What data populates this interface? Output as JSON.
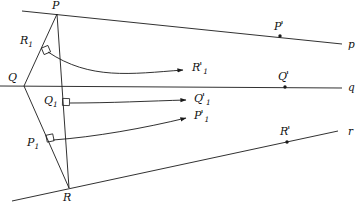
{
  "figure": {
    "kind": "geometry-diagram",
    "background_color": "#ffffff",
    "stroke_color": "#1a1a1a"
  },
  "vertices": [
    {
      "id": "P",
      "label": "P",
      "x": 57,
      "y": 14,
      "label_x": 52,
      "label_y": 0
    },
    {
      "id": "Q",
      "label": "Q",
      "x": 24,
      "y": 86,
      "label_x": 8,
      "label_y": 72
    },
    {
      "id": "R",
      "label": "R",
      "x": 69,
      "y": 188,
      "label_x": 63,
      "label_y": 192
    }
  ],
  "feet": [
    {
      "id": "R1",
      "letter": "R",
      "sub": "1",
      "x": 44,
      "y": 48,
      "label_x": 20,
      "label_y": 35
    },
    {
      "id": "Q1",
      "letter": "Q",
      "sub": "1",
      "x": 64,
      "y": 101,
      "label_x": 44,
      "label_y": 95
    },
    {
      "id": "P1",
      "letter": "P",
      "sub": "1",
      "x": 48,
      "y": 137,
      "label_x": 27,
      "label_y": 137
    }
  ],
  "lines": [
    {
      "id": "p",
      "label": "p",
      "label_x": 348,
      "label_y": 39,
      "x1": 22,
      "y1": 11,
      "x2": 342,
      "y2": 44,
      "point": {
        "id": "Pprime",
        "letter": "P",
        "prime": "'",
        "x": 280,
        "y": 36,
        "label_x": 274,
        "label_y": 21
      }
    },
    {
      "id": "q",
      "label": "q",
      "label_x": 348,
      "label_y": 82,
      "x1": 0,
      "y1": 86,
      "x2": 342,
      "y2": 88,
      "point": {
        "id": "Qprime",
        "letter": "Q",
        "prime": "'",
        "x": 285,
        "y": 87,
        "label_x": 278,
        "label_y": 71
      }
    },
    {
      "id": "r",
      "label": "r",
      "label_x": 348,
      "label_y": 126,
      "x1": 12,
      "y1": 201,
      "x2": 338,
      "y2": 131,
      "point": {
        "id": "Rprime",
        "letter": "R",
        "prime": "'",
        "x": 287,
        "y": 142,
        "label_x": 280,
        "label_y": 126
      }
    }
  ],
  "arrows": [
    {
      "id": "R1-to-R1prime",
      "letter": "R",
      "sub": "1",
      "prime": "'",
      "label_x": 192,
      "label_y": 62,
      "tip_x": 183,
      "tip_y": 70,
      "path": "M 48 52 C 90 80 130 74 183 70"
    },
    {
      "id": "Q1-to-Q1prime",
      "letter": "Q",
      "sub": "1",
      "prime": "'",
      "label_x": 194,
      "label_y": 93,
      "tip_x": 186,
      "tip_y": 100,
      "path": "M 70 103 C 110 103 150 101 186 100"
    },
    {
      "id": "P1-to-P1prime",
      "letter": "P",
      "sub": "1",
      "prime": "'",
      "label_x": 194,
      "label_y": 110,
      "tip_x": 186,
      "tip_y": 118,
      "path": "M 53 140 C 95 137 145 128 186 118"
    }
  ],
  "segments": [
    {
      "id": "PQ",
      "x1": 57,
      "y1": 14,
      "x2": 24,
      "y2": 86
    },
    {
      "id": "QR",
      "x1": 24,
      "y1": 86,
      "x2": 69,
      "y2": 188
    },
    {
      "id": "PR",
      "x1": 57,
      "y1": 14,
      "x2": 69,
      "y2": 188
    }
  ],
  "right_angle_markers": [
    {
      "id": "marker-R1",
      "x": 46,
      "y": 50,
      "rotate": -23
    },
    {
      "id": "marker-Q1",
      "x": 66,
      "y": 102,
      "rotate": 2
    },
    {
      "id": "marker-P1",
      "x": 50,
      "y": 138,
      "rotate": -12
    }
  ]
}
